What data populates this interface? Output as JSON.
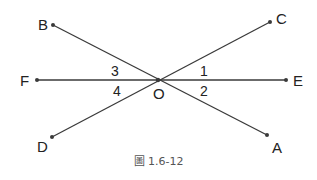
{
  "figure": {
    "caption": "圖 1.6-12",
    "line_color": "#3a3a3a",
    "text_color": "#222222",
    "center": {
      "name": "O",
      "x": 158,
      "y": 80
    },
    "points": [
      {
        "name": "A",
        "x": 267,
        "y": 135
      },
      {
        "name": "B",
        "x": 53,
        "y": 25
      },
      {
        "name": "C",
        "x": 270,
        "y": 22
      },
      {
        "name": "D",
        "x": 52,
        "y": 137
      },
      {
        "name": "E",
        "x": 286,
        "y": 80
      },
      {
        "name": "F",
        "x": 37,
        "y": 80
      }
    ],
    "lines": [
      {
        "from": "B",
        "to": "A"
      },
      {
        "from": "D",
        "to": "C"
      },
      {
        "from": "F",
        "to": "E"
      }
    ],
    "angle_labels": [
      {
        "text": "1",
        "between": "OC-OE"
      },
      {
        "text": "2",
        "between": "OE-OA"
      },
      {
        "text": "3",
        "between": "OB-OF"
      },
      {
        "text": "4",
        "between": "OF-OD"
      }
    ]
  }
}
